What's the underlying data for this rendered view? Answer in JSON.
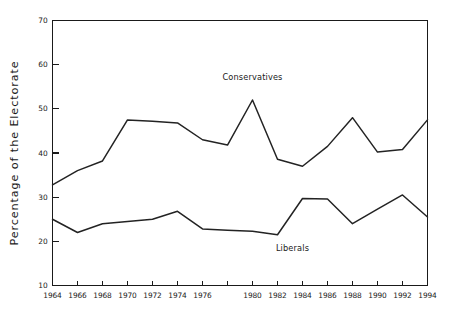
{
  "chart_data": {
    "type": "line",
    "title": "",
    "xlabel": "",
    "ylabel": "Percentage of the Electorate",
    "xlim": [
      1963,
      1995
    ],
    "ylim": [
      10,
      70
    ],
    "yticks": [
      10,
      20,
      30,
      40,
      50,
      60,
      70
    ],
    "ytick_labels": [
      "10",
      "20",
      "30",
      "40",
      "50",
      "60",
      "70"
    ],
    "x": [
      1964,
      1966,
      1968,
      1970,
      1972,
      1974,
      1976,
      1978,
      1980,
      1982,
      1984,
      1986,
      1988,
      1990,
      1992,
      1994
    ],
    "xtick_labels": [
      "1964",
      "1966",
      "1968",
      "1970",
      "1972",
      "1974",
      "1976",
      "",
      "1980",
      "1982",
      "1984",
      "1986",
      "1988",
      "1990",
      "1992",
      "1994"
    ],
    "grid": false,
    "legend_position": "inline-annotation",
    "series": [
      {
        "name": "Conservatives",
        "label_x": 1980,
        "label_y": 56.5,
        "values": [
          32.8,
          36.0,
          38.2,
          47.5,
          47.2,
          46.8,
          43.0,
          41.8,
          52.0,
          38.6,
          37.0,
          41.5,
          48.0,
          40.2,
          40.8,
          47.5
        ]
      },
      {
        "name": "Liberals",
        "label_x": 1983.2,
        "label_y": 17.8,
        "values": [
          25.0,
          22.0,
          24.0,
          24.5,
          25.0,
          26.8,
          22.8,
          22.5,
          22.3,
          21.5,
          29.7,
          29.6,
          24.0,
          27.3,
          30.5,
          25.5
        ]
      }
    ],
    "annotations": [
      {
        "text": "Conservatives"
      },
      {
        "text": "Liberals"
      }
    ]
  }
}
